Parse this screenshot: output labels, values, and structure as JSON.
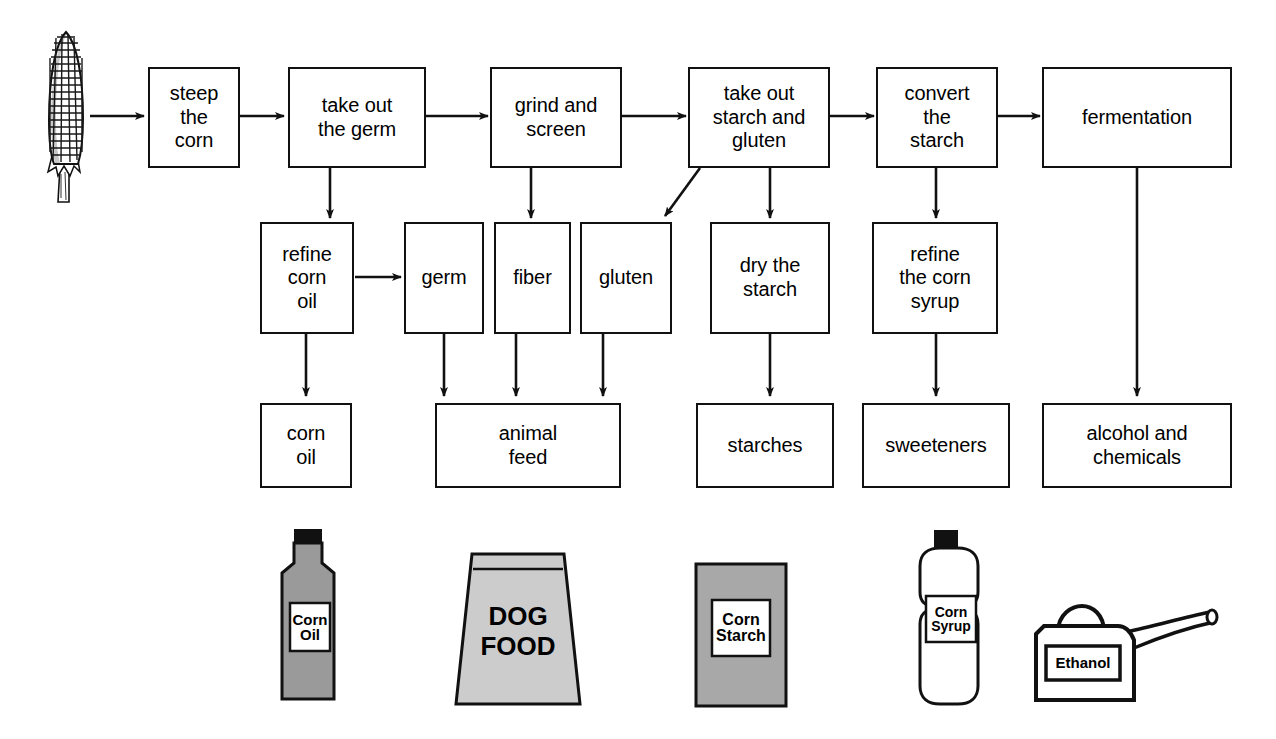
{
  "diagram": {
    "background_color": "#ffffff",
    "line_color": "#111111"
  },
  "source_icon": {
    "name": "corn-cob-illustration",
    "label": "corn cob"
  },
  "process_row": [
    {
      "id": "steep",
      "label": "steep\nthe\ncorn"
    },
    {
      "id": "germ_out",
      "label": "take out\nthe germ"
    },
    {
      "id": "grind",
      "label": "grind and\nscreen"
    },
    {
      "id": "starch_gluten_out",
      "label": "take out\nstarch and\ngluten"
    },
    {
      "id": "convert",
      "label": "convert\nthe\nstarch"
    },
    {
      "id": "fermentation",
      "label": "fermentation"
    }
  ],
  "intermediate_row": [
    {
      "id": "refine_oil",
      "label": "refine\ncorn\noil"
    },
    {
      "id": "germ",
      "label": "germ"
    },
    {
      "id": "fiber",
      "label": "fiber"
    },
    {
      "id": "gluten",
      "label": "gluten"
    },
    {
      "id": "dry_starch",
      "label": "dry the\nstarch"
    },
    {
      "id": "refine_syrup",
      "label": "refine\nthe corn\nsyrup"
    }
  ],
  "product_row": [
    {
      "id": "corn_oil",
      "label": "corn\noil"
    },
    {
      "id": "animal_feed",
      "label": "animal\nfeed"
    },
    {
      "id": "starches",
      "label": "starches"
    },
    {
      "id": "sweeteners",
      "label": "sweeteners"
    },
    {
      "id": "alcohol",
      "label": "alcohol and\nchemicals"
    }
  ],
  "product_illustrations": [
    {
      "id": "corn_oil_bottle",
      "icon": "bottle-icon",
      "line1": "Corn",
      "line2": "Oil",
      "fill": "#9a9a9a"
    },
    {
      "id": "dog_food_bag",
      "icon": "bag-icon",
      "line1": "DOG",
      "line2": "FOOD",
      "fill": "#cccccc"
    },
    {
      "id": "corn_starch_box",
      "icon": "box-icon",
      "line1": "Corn",
      "line2": "Starch",
      "fill": "#a8a8a8"
    },
    {
      "id": "corn_syrup_bottle",
      "icon": "bottle-icon",
      "line1": "Corn",
      "line2": "Syrup",
      "fill": "#ffffff"
    },
    {
      "id": "ethanol_can",
      "icon": "gas-can-icon",
      "line1": "Ethanol",
      "line2": "",
      "fill": "#ffffff"
    }
  ]
}
